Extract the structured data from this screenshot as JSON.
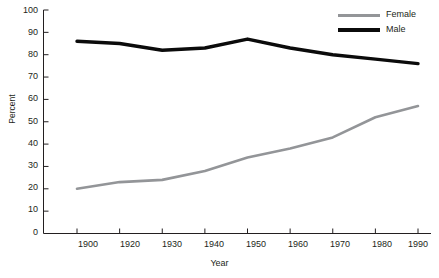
{
  "chart_data": {
    "type": "line",
    "title": "",
    "xlabel": "Year",
    "ylabel": "Percent",
    "categories": [
      "1900",
      "1920",
      "1930",
      "1940",
      "1950",
      "1960",
      "1970",
      "1980",
      "1990"
    ],
    "series": [
      {
        "name": "Female",
        "color": "#939598",
        "values": [
          20,
          23,
          24,
          28,
          34,
          38,
          43,
          52,
          57
        ]
      },
      {
        "name": "Male",
        "color": "#0b0b0b",
        "values": [
          86,
          85,
          82,
          83,
          87,
          83,
          80,
          78,
          76
        ]
      }
    ],
    "ylim": [
      0,
      100
    ],
    "yticks": [
      0,
      10,
      20,
      30,
      40,
      50,
      60,
      70,
      80,
      90,
      100
    ],
    "ytick_labels": [
      "0",
      "10",
      "20",
      "30",
      "40",
      "50",
      "60",
      "70",
      "80",
      "90",
      "100"
    ],
    "grid": false,
    "legend_position": "top-right",
    "legend_entries": [
      "Female",
      "Male"
    ]
  },
  "axes": {
    "y_title": "Percent",
    "x_title": "Year"
  },
  "legend": {
    "items": [
      {
        "label": "Female"
      },
      {
        "label": "Male"
      }
    ]
  }
}
